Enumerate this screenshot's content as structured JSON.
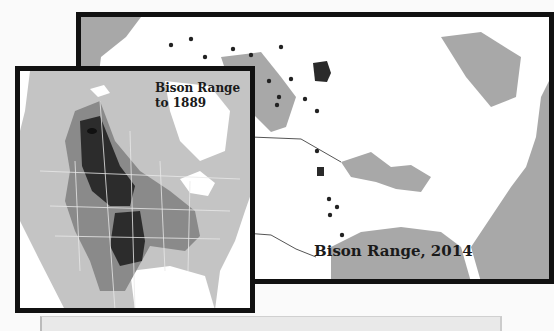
{
  "maps": {
    "modern": {
      "title": "Bison Range, 2014",
      "colors": {
        "land": "#ffffff",
        "water": "#a8a8a8",
        "range": "#2a2a2a",
        "dot": "#222222",
        "frame": "#111111"
      }
    },
    "historic": {
      "title_line1": "Bison Range",
      "title_line2": "to 1889",
      "colors": {
        "outer_land": "#c4c4c4",
        "range_mid": "#8a8a8a",
        "range_core": "#2c2c2c",
        "water": "#ffffff",
        "frame": "#111111"
      }
    }
  }
}
